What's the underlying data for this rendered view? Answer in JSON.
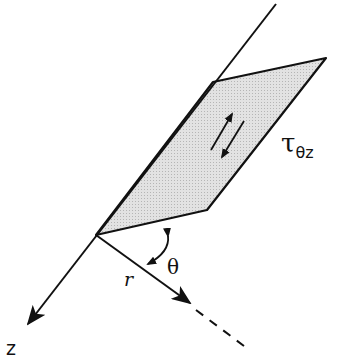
{
  "diagram": {
    "labels": {
      "z_axis": "z",
      "radial": "r",
      "angle": "θ",
      "shear_stress_symbol": "τ",
      "shear_stress_subscript": "θz"
    },
    "colors": {
      "line": "#111111",
      "plane_fill": "#d9d9d9",
      "background": "#ffffff"
    }
  }
}
